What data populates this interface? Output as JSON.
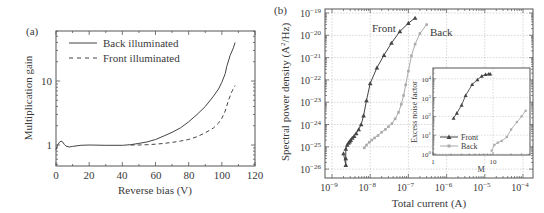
{
  "chart_data": [
    {
      "panel": "(a)",
      "type": "line",
      "title": "",
      "xlabel": "Reverse bias (V)",
      "ylabel": "Multiplication gain",
      "xlim": [
        0,
        120
      ],
      "ylim": [
        0.47,
        60
      ],
      "yscale": "log",
      "xticks": [
        0,
        20,
        40,
        60,
        80,
        100,
        120
      ],
      "yticks": [
        1,
        10
      ],
      "grid": false,
      "legend_position": "upper left",
      "series": [
        {
          "name": "Back illuminated",
          "style": "solid",
          "x": [
            0,
            1,
            2,
            3,
            4,
            5,
            6,
            8,
            10,
            15,
            20,
            30,
            40,
            45,
            50,
            55,
            60,
            65,
            70,
            75,
            80,
            85,
            90,
            95,
            98,
            100,
            102,
            103,
            105,
            107,
            108
          ],
          "y": [
            0.85,
            1.0,
            1.1,
            1.15,
            1.12,
            1.02,
            0.96,
            0.93,
            0.95,
            0.99,
            1.0,
            0.99,
            0.99,
            1.01,
            1.06,
            1.12,
            1.22,
            1.38,
            1.58,
            1.85,
            2.3,
            3.0,
            4.0,
            5.8,
            7.5,
            9.5,
            13,
            17,
            25,
            33,
            40
          ]
        },
        {
          "name": "Front illuminated",
          "style": "dashed",
          "x": [
            45,
            50,
            55,
            60,
            65,
            70,
            75,
            80,
            85,
            90,
            95,
            98,
            100,
            102,
            104,
            106,
            108
          ],
          "y": [
            1.0,
            1.0,
            1.01,
            1.03,
            1.06,
            1.1,
            1.15,
            1.22,
            1.35,
            1.55,
            1.85,
            2.2,
            2.6,
            3.4,
            5.0,
            6.8,
            8.5
          ]
        }
      ]
    },
    {
      "panel": "(b)",
      "type": "scatter",
      "title": "",
      "xlabel": "Total current (A)",
      "ylabel": "Spectral power density (A²/Hz)",
      "xscale": "log",
      "yscale": "log",
      "xlim": [
        1e-09,
        0.0001
      ],
      "ylim": [
        1e-26,
        1e-19
      ],
      "xticklabels": [
        "10⁻⁹",
        "10⁻⁸",
        "10⁻⁷",
        "10⁻⁶",
        "10⁻⁵",
        "10⁻⁴"
      ],
      "yticklabels": [
        "10⁻¹⁹",
        "10⁻²⁰",
        "10⁻²¹",
        "10⁻²²",
        "10⁻²³",
        "10⁻²⁴",
        "10⁻²⁵",
        "10⁻²⁶"
      ],
      "grid": true,
      "annotations": [
        "Front",
        "Back"
      ],
      "series": [
        {
          "name": "Front",
          "marker": "triangle",
          "color": "#555555",
          "x": [
            2e-09,
            2.3e-09,
            2.3e-09,
            2.3e-09,
            2.5e-09,
            2.7e-09,
            2.9e-09,
            3.1e-09,
            3.4e-09,
            3.8e-09,
            4.3e-09,
            5e-09,
            5.8e-09,
            6.7e-09,
            8e-09,
            1e-08,
            1.5e-08,
            2.3e-08,
            3.6e-08,
            6e-08,
            1e-07,
            1.5e-07
          ],
          "y": [
            5e-26,
            1.5e-26,
            3e-26,
            8e-26,
            1.2e-25,
            1.5e-25,
            1.7e-25,
            2e-25,
            2.5e-25,
            3e-25,
            4e-25,
            6e-25,
            1e-24,
            2.5e-24,
            1.2e-23,
            7e-23,
            3.5e-22,
            1.3e-21,
            4.5e-21,
            1.5e-20,
            3.5e-20,
            6e-20
          ]
        },
        {
          "name": "Back",
          "marker": "square",
          "color": "#aaaaaa",
          "x": [
            7e-09,
            8e-09,
            9.5e-09,
            1.1e-08,
            1.3e-08,
            1.6e-08,
            2e-08,
            2.5e-08,
            3e-08,
            3.7e-08,
            4.5e-08,
            5.5e-08,
            6.5e-08,
            7.5e-08,
            8.5e-08,
            1e-07,
            1.2e-07,
            1.5e-07,
            2e-07,
            3e-07
          ],
          "y": [
            9e-26,
            1.2e-25,
            1.6e-25,
            2e-25,
            2.5e-25,
            3.2e-25,
            4.5e-25,
            6e-25,
            8e-25,
            1.1e-24,
            1.8e-24,
            3.5e-24,
            8e-24,
            2e-23,
            6e-23,
            2.5e-22,
            1.2e-21,
            4e-21,
            1.2e-20,
            3e-20
          ]
        }
      ]
    },
    {
      "panel": "(b) inset",
      "type": "scatter",
      "xlabel": "M",
      "ylabel": "Excess noise factor",
      "xscale": "log",
      "yscale": "log",
      "xlim": [
        1,
        41
      ],
      "ylim": [
        1,
        10000.0
      ],
      "xticklabels": [
        "1",
        "10"
      ],
      "yticklabels": [
        "10⁰",
        "10¹",
        "10²",
        "10³",
        "10⁴"
      ],
      "grid": true,
      "legend_position": "lower left",
      "series": [
        {
          "name": "Front",
          "marker": "triangle",
          "x": [
            2.2,
            2.5,
            3.0,
            3.5,
            4.5,
            5.5,
            6.5,
            7.5,
            8.5,
            9.0
          ],
          "y": [
            80,
            150,
            400,
            1300,
            5000,
            9000,
            14000,
            17000,
            18000,
            18000
          ]
        },
        {
          "name": "Back",
          "marker": "square",
          "x": [
            9.5,
            10.5,
            12,
            14,
            17,
            20,
            25,
            30,
            35
          ],
          "y": [
            1.5,
            3,
            4,
            5,
            8,
            20,
            50,
            100,
            200
          ]
        }
      ]
    }
  ],
  "labels": {
    "panel_a": "(a)",
    "panel_b": "(b)",
    "a_xlabel": "Reverse bias (V)",
    "a_ylabel": "Multiplication gain",
    "a_legend_back": "Back illuminated",
    "a_legend_front": "Front illuminated",
    "a_xticks": [
      "0",
      "20",
      "40",
      "60",
      "80",
      "100",
      "120"
    ],
    "a_yticks": [
      "1",
      "10"
    ],
    "b_xlabel": "Total current (A)",
    "b_ylabel_main": "Spectral power density (A",
    "b_ylabel_sup": "2",
    "b_ylabel_end": "/Hz)",
    "b_front": "Front",
    "b_back": "Back",
    "b_xexp": [
      "−9",
      "−8",
      "−7",
      "−6",
      "−5",
      "−4"
    ],
    "b_yexp": [
      "−19",
      "−20",
      "−21",
      "−22",
      "−23",
      "−24",
      "−25",
      "−26"
    ],
    "base": "10",
    "inset_xlabel": "M",
    "inset_ylabel": "Excess noise factor",
    "inset_xticks": [
      "1",
      "10"
    ],
    "inset_yexp": [
      "0",
      "1",
      "2",
      "3",
      "4"
    ],
    "inset_legend_front": "Front",
    "inset_legend_back": "Back"
  }
}
